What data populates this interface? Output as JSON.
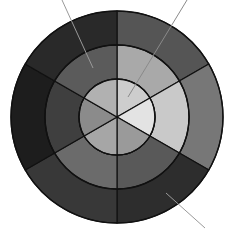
{
  "diagram": {
    "type": "bullseye",
    "center": [
      117,
      117
    ],
    "radii": {
      "inner": 38,
      "middle": 72,
      "outer": 106
    },
    "segment_angles_deg": [
      -90,
      -30,
      30,
      90,
      150,
      210,
      270
    ],
    "segments": [
      {
        "id": "top-right",
        "start": -90,
        "end": -30,
        "outer": "#555555",
        "middle": "#a9a9a9",
        "inner": "#cdcdcd"
      },
      {
        "id": "right",
        "start": -30,
        "end": 30,
        "outer": "#777777",
        "middle": "#c9c9c9",
        "inner": "#e3e3e3"
      },
      {
        "id": "bottom-right",
        "start": 30,
        "end": 90,
        "outer": "#2d2d2d",
        "middle": "#595959",
        "inner": "#9a9a9a"
      },
      {
        "id": "bottom-left",
        "start": 90,
        "end": 150,
        "outer": "#383838",
        "middle": "#6b6b6b",
        "inner": "#a6a6a6"
      },
      {
        "id": "left",
        "start": 150,
        "end": 210,
        "outer": "#1d1d1d",
        "middle": "#3f3f3f",
        "inner": "#8b8b8b"
      },
      {
        "id": "top-left",
        "start": 210,
        "end": 270,
        "outer": "#292929",
        "middle": "#5b5b5b",
        "inner": "#b1b1b1"
      }
    ],
    "stroke_color": "#111111",
    "leader_lines": [
      {
        "id": "leader-top-left",
        "x1": 62,
        "y1": 0,
        "x2": 93,
        "y2": 68,
        "color": "#9a9a9a"
      },
      {
        "id": "leader-top-right",
        "x1": 187,
        "y1": 0,
        "x2": 128,
        "y2": 97,
        "color": "#8a8a8a"
      },
      {
        "id": "leader-bottom-right",
        "x1": 205,
        "y1": 228,
        "x2": 166,
        "y2": 193,
        "color": "#9a9a9a"
      }
    ]
  }
}
